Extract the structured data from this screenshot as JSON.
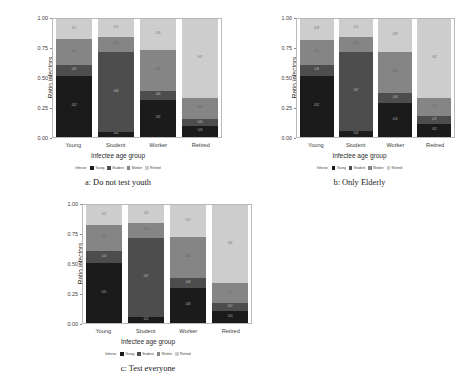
{
  "chart_data": [
    {
      "id": "a",
      "type": "bar",
      "stacked": true,
      "normalized": true,
      "title": "",
      "caption": "a: Do not test youth",
      "xlabel": "Infectee age group",
      "ylabel": "Ratio infectors",
      "categories": [
        "Young",
        "Student",
        "Worker",
        "Retired"
      ],
      "ylim": [
        0.0,
        1.0
      ],
      "yticks": [
        "0.00",
        "0.25",
        "0.50",
        "0.75",
        "1.00"
      ],
      "ytick_values": [
        0.0,
        0.25,
        0.5,
        0.75,
        1.0
      ],
      "grid": false,
      "legend_title": "Infector",
      "legend_position": "bottom",
      "series": [
        {
          "name": "Young",
          "color": "#1b1b1b",
          "values": [
            0.52,
            0.04,
            0.31,
            0.09
          ]
        },
        {
          "name": "Student",
          "color": "#4d4d4d",
          "values": [
            0.09,
            0.68,
            0.08,
            0.06
          ]
        },
        {
          "name": "Worker",
          "color": "#858585",
          "values": [
            0.22,
            0.13,
            0.35,
            0.18
          ]
        },
        {
          "name": "Retired",
          "color": "#cdcdcd",
          "values": [
            0.17,
            0.15,
            0.26,
            0.67
          ]
        }
      ],
      "bar_labels": [
        [
          "0.52",
          "0.09",
          "0.22",
          "0.17"
        ],
        [
          "0.04",
          "0.68",
          "0.13",
          "0.15"
        ],
        [
          "0.31",
          "0.08",
          "0.35",
          "0.26"
        ],
        [
          "0.09",
          "0.06",
          "0.18",
          "0.67"
        ]
      ]
    },
    {
      "id": "b",
      "type": "bar",
      "stacked": true,
      "normalized": true,
      "title": "",
      "caption": "b: Only Elderly",
      "xlabel": "Infectee age group",
      "ylabel": "Ratio infectors",
      "categories": [
        "Young",
        "Student",
        "Worker",
        "Retired"
      ],
      "ylim": [
        0.0,
        1.0
      ],
      "yticks": [
        "0.00",
        "0.25",
        "0.50",
        "0.75",
        "1.00"
      ],
      "ytick_values": [
        0.0,
        0.25,
        0.5,
        0.75,
        1.0
      ],
      "grid": false,
      "legend_title": "Infector",
      "legend_position": "bottom",
      "series": [
        {
          "name": "Young",
          "color": "#1b1b1b",
          "values": [
            0.52,
            0.05,
            0.29,
            0.11
          ]
        },
        {
          "name": "Student",
          "color": "#4d4d4d",
          "values": [
            0.09,
            0.67,
            0.08,
            0.07
          ]
        },
        {
          "name": "Worker",
          "color": "#858585",
          "values": [
            0.21,
            0.13,
            0.35,
            0.15
          ]
        },
        {
          "name": "Retired",
          "color": "#cdcdcd",
          "values": [
            0.18,
            0.15,
            0.28,
            0.67
          ]
        }
      ],
      "bar_labels": [
        [
          "0.52",
          "0.09",
          "0.21",
          "0.18"
        ],
        [
          "0.05",
          "0.67",
          "0.13",
          "0.15"
        ],
        [
          "0.29",
          "0.08",
          "0.35",
          "0.28"
        ],
        [
          "0.11",
          "0.07",
          "0.15",
          "0.67"
        ]
      ]
    },
    {
      "id": "c",
      "type": "bar",
      "stacked": true,
      "normalized": true,
      "title": "",
      "caption": "c: Test everyone",
      "xlabel": "Infectee age group",
      "ylabel": "Ratio infectors",
      "categories": [
        "Young",
        "Student",
        "Worker",
        "Retired"
      ],
      "ylim": [
        0.0,
        1.0
      ],
      "yticks": [
        "0.00",
        "0.25",
        "0.50",
        "0.75",
        "1.00"
      ],
      "ytick_values": [
        0.0,
        0.25,
        0.5,
        0.75,
        1.0
      ],
      "grid": false,
      "legend_title": "Infector",
      "legend_position": "bottom",
      "series": [
        {
          "name": "Young",
          "color": "#1b1b1b",
          "values": [
            0.51,
            0.05,
            0.3,
            0.1
          ]
        },
        {
          "name": "Student",
          "color": "#4d4d4d",
          "values": [
            0.1,
            0.67,
            0.08,
            0.07
          ]
        },
        {
          "name": "Worker",
          "color": "#858585",
          "values": [
            0.22,
            0.13,
            0.35,
            0.17
          ]
        },
        {
          "name": "Retired",
          "color": "#cdcdcd",
          "values": [
            0.17,
            0.15,
            0.27,
            0.66
          ]
        }
      ],
      "bar_labels": [
        [
          "0.51",
          "0.10",
          "0.22",
          "0.17"
        ],
        [
          "0.05",
          "0.67",
          "0.13",
          "0.15"
        ],
        [
          "0.30",
          "0.08",
          "0.35",
          "0.27"
        ],
        [
          "0.10",
          "0.07",
          "0.17",
          "0.66"
        ]
      ]
    }
  ],
  "palette": {
    "young": "#1b1b1b",
    "student": "#4d4d4d",
    "worker": "#858585",
    "retired": "#cdcdcd",
    "panel_border": "#b9b9b9",
    "text": "#2b2b2b",
    "background": "#ffffff"
  }
}
